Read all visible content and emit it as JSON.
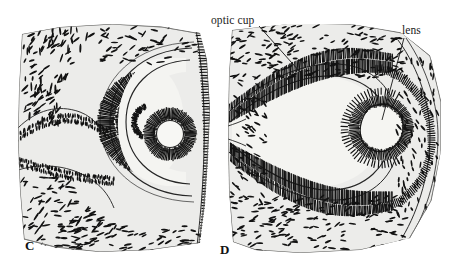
{
  "figure": {
    "background_color": "#ffffff",
    "ink_color": "#1a1a1a",
    "tissue_fill": "#ebebe8",
    "lumen_fill": "#f2f2ef",
    "width": 451,
    "height": 270
  },
  "annotations": {
    "optic_cup": {
      "label": "optic cup",
      "leader_from": [
        259,
        26
      ],
      "leader_to": [
        300,
        72
      ]
    },
    "lens": {
      "label": "lens",
      "leader_from": [
        404,
        38
      ],
      "leader_to": [
        382,
        120
      ]
    }
  },
  "panels": [
    {
      "id": "C",
      "letter": "C",
      "stage_label": "C",
      "structures": [
        "optic cup",
        "lens vesicle",
        "neural retina layer",
        "retinal pigment layer",
        "surface ectoderm",
        "mesenchyme"
      ]
    },
    {
      "id": "D",
      "letter": "D",
      "stage_label": "D",
      "structures": [
        "optic cup",
        "lens vesicle",
        "neural retina layer",
        "retinal pigment layer",
        "optic stalk",
        "surface ectoderm",
        "mesenchyme"
      ]
    }
  ]
}
